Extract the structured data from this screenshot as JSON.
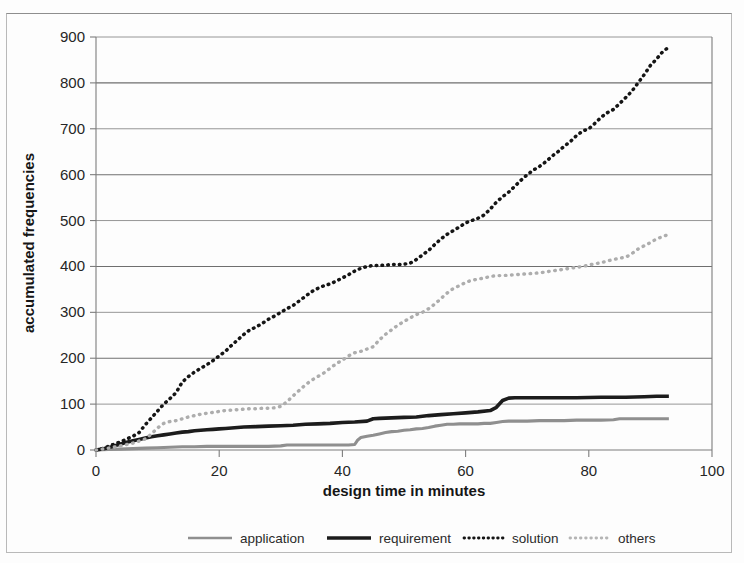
{
  "chart_data": {
    "type": "line",
    "title": "",
    "xlabel": "design time in minutes",
    "ylabel": "accumulated frequencies",
    "xlim": [
      0,
      100
    ],
    "ylim": [
      0,
      900
    ],
    "xticks": [
      0,
      20,
      40,
      60,
      80,
      100
    ],
    "yticks": [
      0,
      100,
      200,
      300,
      400,
      500,
      600,
      700,
      800,
      900
    ],
    "grid": "horizontal",
    "legend_position": "bottom",
    "legend": [
      "application",
      "requirement",
      "solution",
      "others"
    ],
    "series": [
      {
        "name": "application",
        "style": "solid",
        "color": "#8f8f8f",
        "points": [
          [
            0,
            0
          ],
          [
            2,
            1
          ],
          [
            4,
            2
          ],
          [
            6,
            3
          ],
          [
            8,
            4
          ],
          [
            10,
            5
          ],
          [
            12,
            6
          ],
          [
            14,
            7
          ],
          [
            16,
            7
          ],
          [
            18,
            8
          ],
          [
            20,
            8
          ],
          [
            22,
            8
          ],
          [
            24,
            8
          ],
          [
            26,
            8
          ],
          [
            28,
            8
          ],
          [
            30,
            9
          ],
          [
            31,
            11
          ],
          [
            33,
            11
          ],
          [
            35,
            11
          ],
          [
            37,
            11
          ],
          [
            39,
            11
          ],
          [
            41,
            11
          ],
          [
            42,
            12
          ],
          [
            42.5,
            22
          ],
          [
            43,
            27
          ],
          [
            44,
            30
          ],
          [
            45,
            32
          ],
          [
            46,
            35
          ],
          [
            47,
            38
          ],
          [
            48,
            40
          ],
          [
            49,
            41
          ],
          [
            50,
            43
          ],
          [
            51,
            44
          ],
          [
            52,
            46
          ],
          [
            53,
            47
          ],
          [
            54,
            49
          ],
          [
            55,
            52
          ],
          [
            56,
            54
          ],
          [
            57,
            56
          ],
          [
            58,
            56
          ],
          [
            59,
            57
          ],
          [
            60,
            57
          ],
          [
            61,
            57
          ],
          [
            62,
            57
          ],
          [
            63,
            58
          ],
          [
            64,
            58
          ],
          [
            65,
            60
          ],
          [
            66,
            62
          ],
          [
            67,
            63
          ],
          [
            68,
            63
          ],
          [
            70,
            63
          ],
          [
            72,
            64
          ],
          [
            74,
            64
          ],
          [
            76,
            64
          ],
          [
            78,
            65
          ],
          [
            80,
            65
          ],
          [
            82,
            65
          ],
          [
            84,
            66
          ],
          [
            85,
            68
          ],
          [
            87,
            68
          ],
          [
            89,
            68
          ],
          [
            91,
            68
          ],
          [
            93,
            68
          ]
        ]
      },
      {
        "name": "requirement",
        "style": "solid",
        "color": "#1c1c1c",
        "points": [
          [
            0,
            0
          ],
          [
            1,
            2
          ],
          [
            2,
            5
          ],
          [
            3,
            9
          ],
          [
            4,
            13
          ],
          [
            5,
            17
          ],
          [
            6,
            20
          ],
          [
            7,
            23
          ],
          [
            8,
            26
          ],
          [
            9,
            29
          ],
          [
            10,
            31
          ],
          [
            11,
            33
          ],
          [
            12,
            35
          ],
          [
            13,
            37
          ],
          [
            14,
            39
          ],
          [
            15,
            40
          ],
          [
            16,
            42
          ],
          [
            17,
            43
          ],
          [
            18,
            44
          ],
          [
            19,
            45
          ],
          [
            20,
            46
          ],
          [
            21,
            47
          ],
          [
            22,
            48
          ],
          [
            23,
            49
          ],
          [
            24,
            50
          ],
          [
            26,
            51
          ],
          [
            28,
            52
          ],
          [
            30,
            53
          ],
          [
            32,
            54
          ],
          [
            34,
            56
          ],
          [
            36,
            57
          ],
          [
            38,
            58
          ],
          [
            40,
            60
          ],
          [
            42,
            61
          ],
          [
            44,
            63
          ],
          [
            45,
            68
          ],
          [
            46,
            69
          ],
          [
            48,
            70
          ],
          [
            50,
            71
          ],
          [
            52,
            72
          ],
          [
            54,
            75
          ],
          [
            56,
            77
          ],
          [
            58,
            79
          ],
          [
            60,
            81
          ],
          [
            62,
            83
          ],
          [
            64,
            86
          ],
          [
            65,
            93
          ],
          [
            66,
            108
          ],
          [
            67,
            113
          ],
          [
            68,
            114
          ],
          [
            70,
            114
          ],
          [
            74,
            114
          ],
          [
            78,
            114
          ],
          [
            82,
            115
          ],
          [
            86,
            115
          ],
          [
            89,
            116
          ],
          [
            91,
            117
          ],
          [
            93,
            117
          ]
        ]
      },
      {
        "name": "solution",
        "style": "dotted",
        "color": "#151515",
        "points": [
          [
            0,
            0
          ],
          [
            1,
            3
          ],
          [
            2,
            8
          ],
          [
            3,
            13
          ],
          [
            4,
            18
          ],
          [
            5,
            24
          ],
          [
            6,
            30
          ],
          [
            7,
            38
          ],
          [
            8,
            55
          ],
          [
            9,
            70
          ],
          [
            10,
            85
          ],
          [
            11,
            100
          ],
          [
            12,
            112
          ],
          [
            13,
            125
          ],
          [
            14,
            148
          ],
          [
            15,
            160
          ],
          [
            16,
            170
          ],
          [
            17,
            178
          ],
          [
            18,
            186
          ],
          [
            19,
            195
          ],
          [
            20,
            205
          ],
          [
            21,
            215
          ],
          [
            22,
            228
          ],
          [
            23,
            240
          ],
          [
            24,
            252
          ],
          [
            25,
            262
          ],
          [
            26,
            268
          ],
          [
            27,
            276
          ],
          [
            28,
            285
          ],
          [
            29,
            292
          ],
          [
            30,
            300
          ],
          [
            31,
            308
          ],
          [
            32,
            315
          ],
          [
            33,
            325
          ],
          [
            34,
            335
          ],
          [
            35,
            345
          ],
          [
            36,
            352
          ],
          [
            37,
            358
          ],
          [
            38,
            362
          ],
          [
            39,
            368
          ],
          [
            40,
            375
          ],
          [
            41,
            382
          ],
          [
            42,
            390
          ],
          [
            43,
            396
          ],
          [
            44,
            400
          ],
          [
            45,
            402
          ],
          [
            46,
            402
          ],
          [
            47,
            403
          ],
          [
            48,
            404
          ],
          [
            49,
            404
          ],
          [
            50,
            405
          ],
          [
            51,
            407
          ],
          [
            52,
            415
          ],
          [
            53,
            425
          ],
          [
            54,
            435
          ],
          [
            55,
            448
          ],
          [
            56,
            460
          ],
          [
            57,
            470
          ],
          [
            58,
            478
          ],
          [
            59,
            486
          ],
          [
            60,
            495
          ],
          [
            61,
            500
          ],
          [
            62,
            505
          ],
          [
            63,
            512
          ],
          [
            64,
            525
          ],
          [
            65,
            540
          ],
          [
            66,
            552
          ],
          [
            67,
            562
          ],
          [
            68,
            575
          ],
          [
            69,
            588
          ],
          [
            70,
            600
          ],
          [
            71,
            610
          ],
          [
            72,
            618
          ],
          [
            73,
            628
          ],
          [
            74,
            640
          ],
          [
            75,
            650
          ],
          [
            76,
            662
          ],
          [
            77,
            672
          ],
          [
            78,
            685
          ],
          [
            79,
            695
          ],
          [
            80,
            700
          ],
          [
            81,
            712
          ],
          [
            82,
            725
          ],
          [
            83,
            735
          ],
          [
            84,
            742
          ],
          [
            85,
            755
          ],
          [
            86,
            768
          ],
          [
            87,
            782
          ],
          [
            88,
            800
          ],
          [
            89,
            818
          ],
          [
            90,
            838
          ],
          [
            91,
            852
          ],
          [
            92,
            868
          ],
          [
            93,
            878
          ]
        ]
      },
      {
        "name": "others",
        "style": "dotted",
        "color": "#adadad",
        "points": [
          [
            0,
            0
          ],
          [
            2,
            4
          ],
          [
            4,
            9
          ],
          [
            6,
            15
          ],
          [
            8,
            24
          ],
          [
            9,
            35
          ],
          [
            10,
            48
          ],
          [
            11,
            58
          ],
          [
            12,
            62
          ],
          [
            13,
            64
          ],
          [
            14,
            68
          ],
          [
            15,
            72
          ],
          [
            16,
            75
          ],
          [
            17,
            78
          ],
          [
            18,
            80
          ],
          [
            19,
            82
          ],
          [
            20,
            84
          ],
          [
            21,
            86
          ],
          [
            22,
            87
          ],
          [
            23,
            88
          ],
          [
            24,
            89
          ],
          [
            25,
            90
          ],
          [
            26,
            90
          ],
          [
            27,
            91
          ],
          [
            28,
            91
          ],
          [
            29,
            92
          ],
          [
            30,
            95
          ],
          [
            31,
            105
          ],
          [
            32,
            118
          ],
          [
            33,
            130
          ],
          [
            34,
            142
          ],
          [
            35,
            152
          ],
          [
            36,
            160
          ],
          [
            37,
            168
          ],
          [
            38,
            178
          ],
          [
            39,
            188
          ],
          [
            40,
            196
          ],
          [
            41,
            205
          ],
          [
            42,
            212
          ],
          [
            43,
            215
          ],
          [
            44,
            220
          ],
          [
            45,
            225
          ],
          [
            46,
            240
          ],
          [
            47,
            252
          ],
          [
            48,
            262
          ],
          [
            49,
            272
          ],
          [
            50,
            280
          ],
          [
            51,
            288
          ],
          [
            52,
            295
          ],
          [
            53,
            300
          ],
          [
            54,
            308
          ],
          [
            55,
            318
          ],
          [
            56,
            330
          ],
          [
            57,
            342
          ],
          [
            58,
            352
          ],
          [
            59,
            358
          ],
          [
            60,
            365
          ],
          [
            61,
            370
          ],
          [
            62,
            372
          ],
          [
            63,
            375
          ],
          [
            64,
            378
          ],
          [
            65,
            380
          ],
          [
            66,
            380
          ],
          [
            67,
            381
          ],
          [
            68,
            382
          ],
          [
            69,
            383
          ],
          [
            70,
            384
          ],
          [
            71,
            385
          ],
          [
            72,
            386
          ],
          [
            73,
            388
          ],
          [
            74,
            390
          ],
          [
            75,
            392
          ],
          [
            76,
            394
          ],
          [
            77,
            396
          ],
          [
            78,
            398
          ],
          [
            79,
            400
          ],
          [
            80,
            403
          ],
          [
            81,
            406
          ],
          [
            82,
            408
          ],
          [
            83,
            412
          ],
          [
            84,
            415
          ],
          [
            85,
            418
          ],
          [
            86,
            420
          ],
          [
            87,
            428
          ],
          [
            88,
            438
          ],
          [
            89,
            445
          ],
          [
            90,
            452
          ],
          [
            91,
            460
          ],
          [
            92,
            465
          ],
          [
            93,
            470
          ]
        ]
      }
    ]
  }
}
